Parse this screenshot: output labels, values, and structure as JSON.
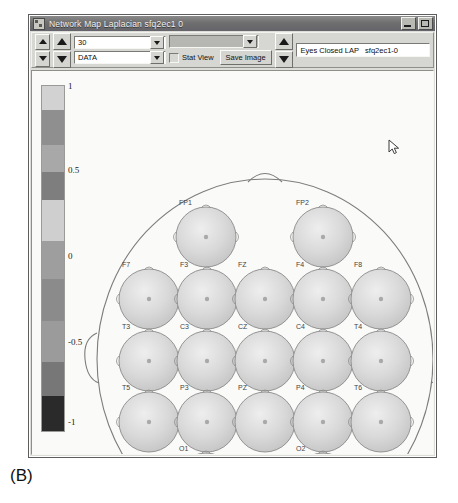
{
  "window": {
    "title": "Network Map    Laplacian sfq2ec1 0",
    "icon": "app-icon",
    "caption_buttons": [
      {
        "name": "minimize",
        "glyph": "_"
      },
      {
        "name": "maximize",
        "glyph": "□"
      }
    ]
  },
  "toolbar": {
    "spinner_small": {
      "up": "▲",
      "down": "▼"
    },
    "spinner_large": {
      "up": "▲",
      "down": "▼"
    },
    "combo_count": {
      "value": "30",
      "name": "count-combo"
    },
    "combo_mode": {
      "value": "DATA",
      "name": "mode-combo"
    },
    "combo_disabled": {
      "value": "",
      "name": "disabled-combo"
    },
    "stat_view": {
      "label": "Stat View",
      "checked": false
    },
    "save_image": {
      "label": "Save Image"
    },
    "nav_spinner": {
      "up": "▲",
      "down": "▼"
    },
    "status_text": "Eyes Closed LAP   sfq2ec1-0"
  },
  "colorbar": {
    "ticks": [
      "1",
      "0.5",
      "0",
      "-0.5",
      "-1"
    ],
    "tick_positions": [
      16,
      100,
      186,
      272,
      352
    ],
    "min": -1,
    "max": 1
  },
  "head_map": {
    "title": "network-map-head",
    "electrodes": [
      {
        "label": "FP1",
        "cx": 174,
        "cy": 166,
        "r": 30
      },
      {
        "label": "FP2",
        "cx": 291,
        "cy": 166,
        "r": 30
      },
      {
        "label": "F7",
        "cx": 117,
        "cy": 228,
        "r": 30
      },
      {
        "label": "F3",
        "cx": 175,
        "cy": 228,
        "r": 30
      },
      {
        "label": "FZ",
        "cx": 233,
        "cy": 228,
        "r": 30
      },
      {
        "label": "F4",
        "cx": 291,
        "cy": 228,
        "r": 30
      },
      {
        "label": "F8",
        "cx": 349,
        "cy": 228,
        "r": 30
      },
      {
        "label": "T3",
        "cx": 117,
        "cy": 290,
        "r": 30
      },
      {
        "label": "C3",
        "cx": 175,
        "cy": 290,
        "r": 30
      },
      {
        "label": "CZ",
        "cx": 233,
        "cy": 290,
        "r": 30
      },
      {
        "label": "C4",
        "cx": 291,
        "cy": 290,
        "r": 30
      },
      {
        "label": "T4",
        "cx": 349,
        "cy": 290,
        "r": 30
      },
      {
        "label": "T5",
        "cx": 117,
        "cy": 351,
        "r": 30
      },
      {
        "label": "P3",
        "cx": 175,
        "cy": 351,
        "r": 30
      },
      {
        "label": "PZ",
        "cx": 233,
        "cy": 351,
        "r": 30
      },
      {
        "label": "P4",
        "cx": 291,
        "cy": 351,
        "r": 30
      },
      {
        "label": "T6",
        "cx": 349,
        "cy": 351,
        "r": 30
      },
      {
        "label": "O1",
        "cx": 174,
        "cy": 412,
        "r": 30
      },
      {
        "label": "O2",
        "cx": 291,
        "cy": 412,
        "r": 30
      }
    ]
  },
  "cursor": {
    "name": "mouse-pointer"
  },
  "caption": {
    "text": "(B)"
  }
}
